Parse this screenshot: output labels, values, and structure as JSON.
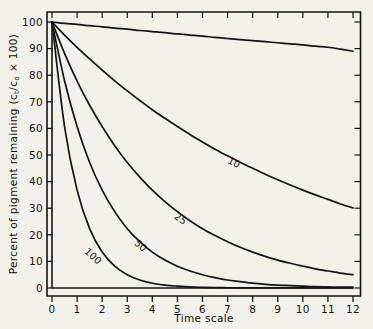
{
  "figure": {
    "background_color": "#f2f1ec",
    "ink_color": "#141414"
  },
  "chart_data": {
    "type": "line",
    "title": "",
    "xlabel": "Time scale",
    "ylabel": "Percent of pigment remaining (cₜ/cₒ × 100)",
    "ylabel_parts": {
      "lead": "Percent of pigment remaining (c",
      "sub1": "t",
      "mid": "/c",
      "sub2": "o",
      "tail": " × 100)"
    },
    "xlim": [
      0,
      12
    ],
    "ylim": [
      0,
      100
    ],
    "xticks": [
      0,
      1,
      2,
      3,
      4,
      5,
      6,
      7,
      8,
      9,
      10,
      11,
      12
    ],
    "xticklabels": [
      "0",
      "1",
      "2",
      "3",
      "4",
      "5",
      "6",
      "7",
      "8",
      "9",
      "10",
      "11",
      "12"
    ],
    "yticks": [
      0,
      10,
      20,
      30,
      40,
      50,
      60,
      70,
      80,
      90,
      100
    ],
    "yticklabels": [
      "0",
      "10",
      "20",
      "30",
      "40",
      "50",
      "60",
      "70",
      "80",
      "90",
      "100"
    ],
    "grid": false,
    "legend": "inline curve labels",
    "x": [
      0,
      0.5,
      1,
      1.5,
      2,
      2.5,
      3,
      3.5,
      4,
      4.5,
      5,
      5.5,
      6,
      6.5,
      7,
      7.5,
      8,
      8.5,
      9,
      9.5,
      10,
      10.5,
      11,
      11.5,
      12
    ],
    "series": [
      {
        "name": "unlabeled",
        "label": "",
        "values": [
          100,
          99.5,
          99.1,
          98.6,
          98.2,
          97.7,
          97.3,
          96.8,
          96.4,
          96.0,
          95.5,
          95.1,
          94.7,
          94.2,
          93.8,
          93.4,
          93.0,
          92.6,
          92.2,
          91.8,
          91.4,
          90.9,
          90.5,
          89.8,
          89.0
        ]
      },
      {
        "name": "rate-10",
        "label": "10",
        "label_x": 7.2,
        "label_y": 46,
        "values": [
          100,
          95.1,
          90.5,
          86.1,
          81.9,
          77.9,
          74.1,
          70.5,
          67.0,
          63.8,
          60.7,
          57.7,
          54.9,
          52.2,
          49.7,
          47.3,
          45.0,
          42.8,
          40.7,
          38.7,
          36.8,
          35.0,
          33.3,
          31.6,
          30.1
        ]
      },
      {
        "name": "rate-25",
        "label": "25",
        "label_x": 5.05,
        "label_y": 25,
        "values": [
          100,
          88.2,
          77.8,
          68.7,
          60.7,
          53.5,
          47.2,
          41.7,
          36.8,
          32.5,
          28.7,
          25.3,
          22.3,
          19.7,
          17.4,
          15.3,
          13.5,
          11.9,
          10.5,
          9.3,
          8.2,
          7.2,
          6.4,
          5.6,
          5.0
        ]
      },
      {
        "name": "rate-50",
        "label": "50",
        "label_x": 3.45,
        "label_y": 15,
        "values": [
          100,
          77.9,
          60.7,
          47.2,
          36.8,
          28.7,
          22.3,
          17.4,
          13.5,
          10.5,
          8.2,
          6.4,
          5.0,
          3.9,
          3.0,
          2.4,
          1.8,
          1.4,
          1.1,
          0.9,
          0.7,
          0.5,
          0.4,
          0.3,
          0.3
        ]
      },
      {
        "name": "rate-100",
        "label": "100",
        "label_x": 1.55,
        "label_y": 11,
        "values": [
          100,
          60.7,
          36.8,
          22.3,
          13.5,
          8.2,
          5.0,
          3.0,
          1.8,
          1.1,
          0.7,
          0.4,
          0.25,
          0.15,
          0.1,
          0.06,
          0.04,
          0.02,
          0.02,
          0.01,
          0.01,
          0.0,
          0.0,
          0.0,
          0.0
        ]
      }
    ]
  }
}
